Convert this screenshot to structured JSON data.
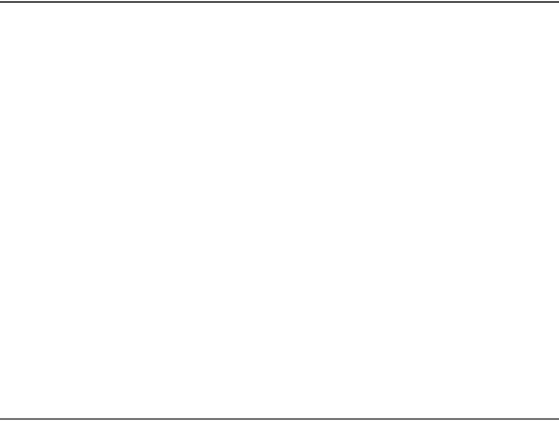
{
  "diagram": {
    "tiles": [
      {
        "id": "top",
        "label": "T",
        "label_pos": [
          287,
          59
        ],
        "label_rotation": 0,
        "outline": [
          [
            153,
            35
          ],
          [
            413,
            35
          ],
          [
            355,
            83
          ],
          [
            217,
            83
          ]
        ]
      },
      {
        "id": "left",
        "label": "T",
        "label_pos": [
          118,
          148
        ],
        "label_rotation": 0,
        "outline": [
          [
            142,
            40
          ],
          [
            168,
            110
          ],
          [
            120,
            227
          ],
          [
            42,
            247
          ]
        ]
      },
      {
        "id": "right",
        "label": "T",
        "label_pos": [
          456,
          148
        ],
        "label_rotation": 0,
        "outline": [
          [
            433,
            42
          ],
          [
            515,
            215
          ],
          [
            527,
            235
          ],
          [
            457,
            215
          ],
          [
            403,
            118
          ]
        ]
      },
      {
        "id": "bottom-left",
        "label": "T",
        "label_pos": [
          180,
          312
        ],
        "label_rotation": -20,
        "outline": [
          [
            131,
            262
          ],
          [
            63,
            284
          ],
          [
            277,
            388
          ],
          [
            248,
            313
          ]
        ]
      },
      {
        "id": "bottom-right",
        "label": "T",
        "label_pos": [
          406,
          310
        ],
        "label_rotation": 20,
        "outline": [
          [
            450,
            256
          ],
          [
            527,
            277
          ],
          [
            313,
            388
          ],
          [
            339,
            322
          ]
        ]
      }
    ],
    "pad_groups": [
      {
        "tile": "top",
        "count": 16,
        "groups_of": 4
      },
      {
        "tile": "left",
        "count": 16,
        "groups_of": 4
      },
      {
        "tile": "right",
        "count": 16,
        "groups_of": 4
      },
      {
        "tile": "bottom-left",
        "count": 16,
        "groups_of": 4
      },
      {
        "tile": "bottom-right",
        "count": 16,
        "groups_of": 4
      }
    ],
    "colors": {
      "line": "#3a3a3a",
      "background": "#ffffff",
      "border": "#555555"
    }
  }
}
